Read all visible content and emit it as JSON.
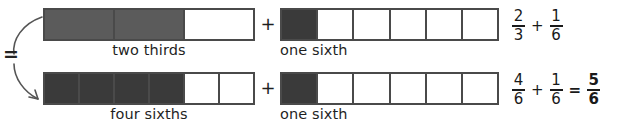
{
  "figure": {
    "equivalence_symbol": "=",
    "colors": {
      "fill_medium": "#5b5b5b",
      "fill_dark": "#3a3a3a",
      "outline": "#4a4a4a",
      "text": "#1f1f1f",
      "background": "#ffffff"
    }
  },
  "rows": [
    {
      "id": "row-top",
      "strips": [
        {
          "name": "two-thirds-strip",
          "total_cells": 3,
          "filled_cells": 2,
          "fill_style": "fill-mid",
          "caption": "two thirds"
        },
        {
          "name": "one-sixth-strip",
          "total_cells": 6,
          "filled_cells": 1,
          "fill_style": "fill-dark",
          "caption": "one sixth"
        }
      ],
      "operator": "+",
      "equation": {
        "terms": [
          {
            "numerator": "2",
            "denominator": "3",
            "bold": false
          },
          {
            "numerator": "1",
            "denominator": "6",
            "bold": false
          }
        ],
        "operators": [
          "+"
        ],
        "result": null
      }
    },
    {
      "id": "row-bottom",
      "strips": [
        {
          "name": "four-sixths-strip",
          "total_cells": 6,
          "filled_cells": 4,
          "fill_style": "fill-dark",
          "caption": "four sixths"
        },
        {
          "name": "one-sixth-strip",
          "total_cells": 6,
          "filled_cells": 1,
          "fill_style": "fill-dark",
          "caption": "one sixth"
        }
      ],
      "operator": "+",
      "equation": {
        "terms": [
          {
            "numerator": "4",
            "denominator": "6",
            "bold": false
          },
          {
            "numerator": "1",
            "denominator": "6",
            "bold": false
          }
        ],
        "operators": [
          "+",
          "="
        ],
        "result": {
          "numerator": "5",
          "denominator": "6",
          "bold": true
        }
      }
    }
  ]
}
